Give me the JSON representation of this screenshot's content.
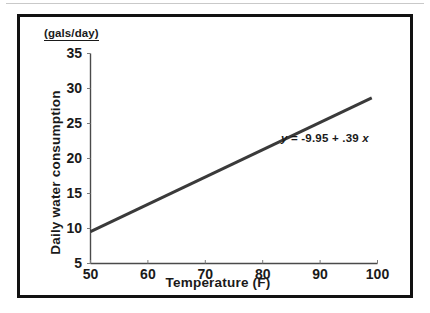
{
  "figure": {
    "units_caption": "(gals/day)",
    "y_axis_title": "Daily water consumption",
    "x_axis_title": "Temperature (F)",
    "equation": {
      "lhs": "y",
      "eq": "=",
      "intercept": "-9.95",
      "plus": "+",
      "slope": ".39",
      "rhs_var": "x",
      "full": "y = -9.95 + .39 x"
    }
  },
  "chart_data": {
    "type": "line",
    "title": "",
    "subtitle": "",
    "xlabel": "Temperature (F)",
    "ylabel": "Daily water consumption",
    "yunits": "(gals/day)",
    "xlim": [
      50,
      100
    ],
    "ylim": [
      5,
      35
    ],
    "xticks": [
      50,
      60,
      70,
      80,
      90,
      100
    ],
    "yticks": [
      5,
      10,
      15,
      20,
      25,
      30,
      35
    ],
    "xtick_labels": [
      "50",
      "60",
      "70",
      "80",
      "90",
      "100"
    ],
    "ytick_labels": [
      "5",
      "10",
      "15",
      "20",
      "25",
      "30",
      "35"
    ],
    "grid": false,
    "legend": false,
    "annotations": [
      {
        "text": "y = -9.95 + .39 x",
        "x": 86,
        "y": 21.5
      }
    ],
    "series": [
      {
        "name": "Fitted regression line",
        "type": "line",
        "equation": "y = -9.95 + 0.39x",
        "intercept": -9.95,
        "slope": 0.39,
        "x": [
          50,
          100
        ],
        "values": [
          9.55,
          29.05
        ],
        "color": "#3a3a3a",
        "linewidth": 3
      }
    ]
  }
}
